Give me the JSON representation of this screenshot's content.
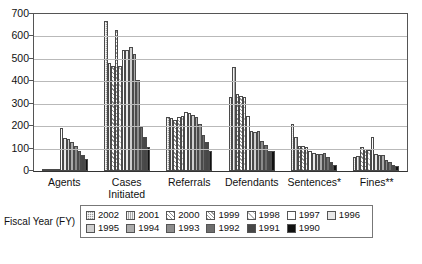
{
  "chart_data": {
    "type": "bar",
    "title": "",
    "xlabel": "",
    "ylabel": "",
    "ylim": [
      0,
      700
    ],
    "yticks": [
      0,
      100,
      200,
      300,
      400,
      500,
      600,
      700
    ],
    "grid": true,
    "legend_position": "bottom",
    "legend_title": "Fiscal Year (FY)",
    "categories": [
      "Agents",
      "Cases Initiated",
      "Referrals",
      "Defendants",
      "Sentences*",
      "Fines**"
    ],
    "series": [
      {
        "name": "2002",
        "values": [
          8,
          670,
          243,
          330,
          208,
          62
        ]
      },
      {
        "name": "2001",
        "values": [
          8,
          480,
          235,
          465,
          150,
          68
        ]
      },
      {
        "name": "2000",
        "values": [
          8,
          470,
          228,
          345,
          112,
          108
        ]
      },
      {
        "name": "1999",
        "values": [
          8,
          630,
          242,
          335,
          112,
          98
        ]
      },
      {
        "name": "1998",
        "values": [
          8,
          470,
          245,
          330,
          108,
          95
        ]
      },
      {
        "name": "1997",
        "values": [
          193,
          540,
          262,
          245,
          88,
          152
        ]
      },
      {
        "name": "1996",
        "values": [
          145,
          538,
          258,
          178,
          80,
          75
        ]
      },
      {
        "name": "1995",
        "values": [
          143,
          553,
          248,
          175,
          75,
          72
        ]
      },
      {
        "name": "1994",
        "values": [
          128,
          522,
          240,
          178,
          78,
          73
        ]
      },
      {
        "name": "1993",
        "values": [
          112,
          407,
          208,
          135,
          80,
          48
        ]
      },
      {
        "name": "1992",
        "values": [
          88,
          198,
          162,
          118,
          62,
          40
        ]
      },
      {
        "name": "1991",
        "values": [
          72,
          152,
          130,
          90,
          42,
          28
        ]
      },
      {
        "name": "1990",
        "values": [
          55,
          105,
          88,
          88,
          28,
          22
        ]
      }
    ]
  },
  "axis": {
    "y_tick_labels": [
      "700",
      "600",
      "500",
      "400",
      "300",
      "200",
      "100",
      "0"
    ]
  },
  "legend": {
    "title": "Fiscal Year (FY)",
    "row1": [
      "2002",
      "2001",
      "2000",
      "1999",
      "1998",
      "1997",
      "1996"
    ],
    "row2": [
      "1995",
      "1994",
      "1993",
      "1992",
      "1991",
      "1990"
    ]
  }
}
